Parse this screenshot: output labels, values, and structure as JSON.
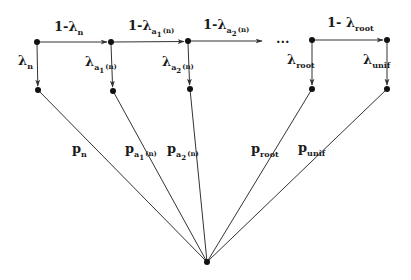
{
  "diagram": {
    "type": "interpolation-chain",
    "nodes": {
      "top": [
        {
          "id": "n",
          "x": 37,
          "y": 42
        },
        {
          "id": "a1",
          "x": 111,
          "y": 42
        },
        {
          "id": "a2",
          "x": 188,
          "y": 41
        },
        {
          "id": "root",
          "x": 312,
          "y": 40
        },
        {
          "id": "unif",
          "x": 387,
          "y": 40
        }
      ],
      "bottom": [
        {
          "id": "n_b",
          "x": 38,
          "y": 90
        },
        {
          "id": "a1_b",
          "x": 113,
          "y": 91
        },
        {
          "id": "a2_b",
          "x": 190,
          "y": 89
        },
        {
          "id": "root_b",
          "x": 312,
          "y": 89
        },
        {
          "id": "unif_b",
          "x": 387,
          "y": 89
        }
      ],
      "sink": {
        "id": "sink",
        "x": 207,
        "y": 262
      }
    },
    "ellipsis": "...",
    "horizontal_labels": [
      {
        "prefix": "1-",
        "symbol": "λ",
        "sub": "n",
        "subsub": "",
        "suffix": ""
      },
      {
        "prefix": "1-",
        "symbol": "λ",
        "sub": "a",
        "subsub": "1",
        "suffix": "(n)"
      },
      {
        "prefix": "1-",
        "symbol": "λ",
        "sub": "a",
        "subsub": "2",
        "suffix": "(n)"
      },
      {
        "prefix": "1- ",
        "symbol": "λ",
        "sub": "root",
        "subsub": "",
        "suffix": ""
      }
    ],
    "vertical_labels": [
      {
        "symbol": "λ",
        "sub": "n",
        "subsub": "",
        "suffix": ""
      },
      {
        "symbol": "λ",
        "sub": "a",
        "subsub": "1",
        "suffix": "(n)"
      },
      {
        "symbol": "λ",
        "sub": "a",
        "subsub": "2",
        "suffix": "(n)"
      },
      {
        "symbol": "λ",
        "sub": "root",
        "subsub": "",
        "suffix": ""
      },
      {
        "symbol": "λ",
        "sub": "unif",
        "subsub": "",
        "suffix": ""
      }
    ],
    "sink_labels": [
      {
        "symbol": "p",
        "sub": "n",
        "subsub": "",
        "suffix": ""
      },
      {
        "symbol": "p",
        "sub": "a",
        "subsub": "1",
        "suffix": "(n)"
      },
      {
        "symbol": "p",
        "sub": "a",
        "subsub": "2",
        "suffix": "(n)"
      },
      {
        "symbol": "p",
        "sub": "root",
        "subsub": "",
        "suffix": ""
      },
      {
        "symbol": "p",
        "sub": "unif",
        "subsub": "",
        "suffix": ""
      }
    ]
  }
}
